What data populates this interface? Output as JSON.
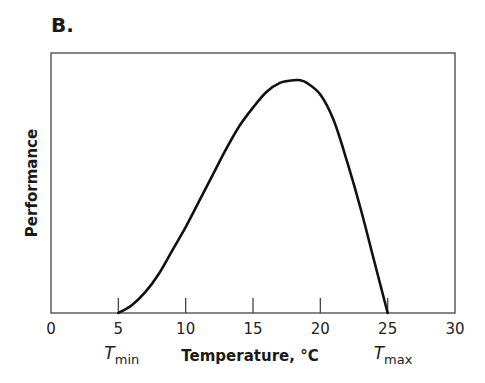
{
  "panel": {
    "label": "B."
  },
  "chart_data": {
    "type": "line",
    "title": "",
    "panel_label": "B.",
    "xlabel": "Temperature, °C",
    "ylabel": "Performance",
    "xlim": [
      0,
      30
    ],
    "ylim": [
      0,
      1
    ],
    "x_ticks": [
      0,
      5,
      10,
      15,
      20,
      25,
      30
    ],
    "y_ticks": [],
    "grid": false,
    "legend": null,
    "annotations": [
      {
        "text": "T",
        "subscript": "min",
        "x": 5
      },
      {
        "text": "T",
        "subscript": "max",
        "x": 25
      }
    ],
    "series": [
      {
        "name": "Thermal performance curve",
        "x": [
          5,
          6,
          7,
          8,
          9,
          10,
          11,
          12,
          13,
          14,
          15,
          16,
          17,
          18,
          18.5,
          19,
          20,
          21,
          22,
          23,
          24,
          25
        ],
        "y": [
          0,
          0.03,
          0.08,
          0.15,
          0.24,
          0.33,
          0.43,
          0.53,
          0.63,
          0.72,
          0.79,
          0.85,
          0.885,
          0.895,
          0.895,
          0.885,
          0.84,
          0.74,
          0.58,
          0.4,
          0.2,
          0
        ]
      }
    ]
  }
}
